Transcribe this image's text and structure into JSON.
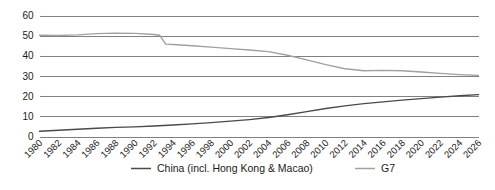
{
  "chart_data": {
    "type": "line",
    "title": "",
    "xlabel": "",
    "ylabel": "",
    "ylim": [
      0,
      60
    ],
    "yticks": [
      0,
      10,
      20,
      30,
      40,
      50,
      60
    ],
    "grid": true,
    "legend_position": "bottom",
    "categories": [
      1980,
      1982,
      1984,
      1986,
      1988,
      1990,
      1992,
      1994,
      1996,
      1998,
      2000,
      2002,
      2004,
      2006,
      2008,
      2010,
      2012,
      2014,
      2016,
      2018,
      2020,
      2022,
      2024,
      2026
    ],
    "tick_labels": [
      "1980",
      "1982",
      "1984",
      "1986",
      "1988",
      "1990",
      "1992",
      "1994",
      "1996",
      "1998",
      "2000",
      "2002",
      "2004",
      "2006",
      "2008",
      "2010",
      "2012",
      "2014",
      "2016",
      "2018",
      "2020",
      "2022",
      "2024",
      "2026"
    ],
    "series": [
      {
        "name": "China (incl. Hong Kong & Macao)",
        "color": "#4a4a4a",
        "values": [
          2.6,
          3.1,
          3.6,
          4.1,
          4.5,
          4.8,
          5.2,
          5.7,
          6.3,
          6.9,
          7.6,
          8.4,
          9.4,
          10.8,
          12.3,
          13.9,
          15.2,
          16.3,
          17.2,
          18.0,
          18.8,
          19.5,
          20.2,
          20.8
        ]
      },
      {
        "name": "G7",
        "color": "#a0a0a0",
        "values": [
          50.2,
          50.1,
          50.4,
          51.0,
          51.3,
          51.1,
          50.6,
          45.6,
          45.0,
          44.3,
          43.6,
          42.9,
          42.1,
          40.3,
          38.0,
          35.6,
          33.6,
          32.6,
          32.8,
          32.6,
          32.0,
          31.3,
          30.7,
          30.3
        ]
      }
    ],
    "breakpoints": [
      {
        "x": 1992.6,
        "series": "G7",
        "from": 50.2,
        "to": 45.8
      }
    ]
  },
  "legend": {
    "items": [
      {
        "label": "China (incl. Hong Kong & Macao)",
        "color": "#4a4a4a"
      },
      {
        "label": "G7",
        "color": "#a0a0a0"
      }
    ]
  },
  "colors": {
    "china_line": "#4a4a4a",
    "g7_line": "#a0a0a0",
    "gridline": "#808080",
    "text": "#1a1a1a",
    "background": "#ffffff"
  }
}
